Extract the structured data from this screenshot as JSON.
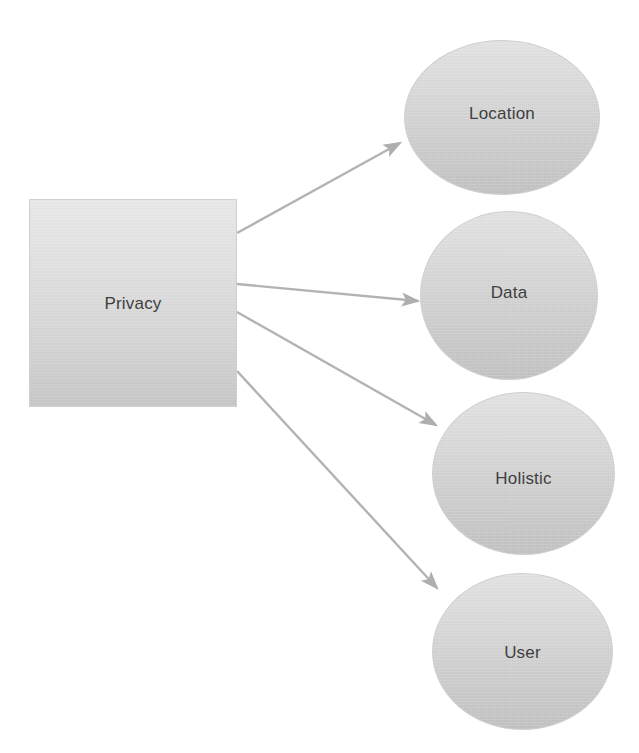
{
  "diagram": {
    "type": "node-edge-diagram",
    "background_color": "#ffffff",
    "shape_fill_light": "#e4e4e4",
    "shape_fill_dark": "#c3c3c3",
    "shape_border_color": "#cfcfcf",
    "label_color": "#3f3f3f",
    "edge_color": "#b0b0b0",
    "root": {
      "label": "Privacy",
      "shape": "rectangle"
    },
    "leaves": [
      {
        "label": "Location",
        "shape": "ellipse"
      },
      {
        "label": "Data",
        "shape": "ellipse"
      },
      {
        "label": "Holistic",
        "shape": "ellipse"
      },
      {
        "label": "User",
        "shape": "ellipse"
      }
    ],
    "edges": [
      {
        "from": "Privacy",
        "to": "Location",
        "arrow": true
      },
      {
        "from": "Privacy",
        "to": "Data",
        "arrow": true
      },
      {
        "from": "Privacy",
        "to": "Holistic",
        "arrow": true
      },
      {
        "from": "Privacy",
        "to": "User",
        "arrow": true
      }
    ]
  }
}
